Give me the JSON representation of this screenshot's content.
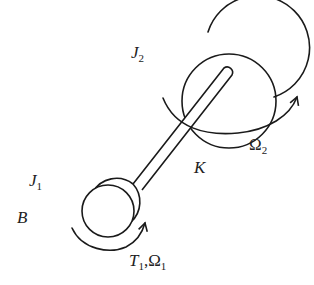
{
  "diagram": {
    "type": "mechanical-schematic",
    "colors": {
      "line": "#1a1a1a",
      "text": "#222222",
      "background": "#ffffff"
    },
    "labels": {
      "j2": {
        "main": "J",
        "sub": "2"
      },
      "omega2": {
        "main": "Ω",
        "sub": "2"
      },
      "k": {
        "main": "K"
      },
      "j1": {
        "main": "J",
        "sub": "1"
      },
      "b": {
        "main": "B"
      },
      "t1_omega1": {
        "t_main": "T",
        "t_sub": "1",
        "sep": ",",
        "omega_main": "Ω",
        "omega_sub": "1"
      }
    },
    "components": [
      {
        "id": "large-disc",
        "label": "J2"
      },
      {
        "id": "shaft",
        "label": "K"
      },
      {
        "id": "small-disc",
        "label": "J1"
      },
      {
        "id": "rotation-arrow-omega2",
        "label": "Ω2"
      },
      {
        "id": "rotation-arrow-t1-omega1",
        "label": "T1,Ω1"
      }
    ]
  }
}
